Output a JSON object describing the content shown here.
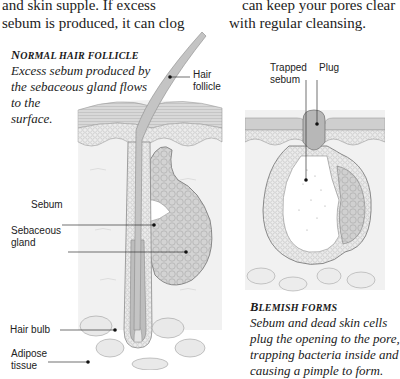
{
  "body_text": {
    "left_lines": [
      "and skin supple. If excess",
      "sebum is produced, it can clog"
    ],
    "right_lines": [
      "can keep your pores clear",
      "with regular cleansing."
    ]
  },
  "left_figure": {
    "title_first": "N",
    "title_rest": "ORMAL HAIR FOLLICLE",
    "caption_lines": [
      "Excess sebum produced by",
      "the sebaceous gland flows",
      "to the",
      "surface."
    ],
    "labels": {
      "hair_follicle_1": "Hair",
      "hair_follicle_2": "follicle",
      "sebum": "Sebum",
      "sebaceous_gland_1": "Sebaceous",
      "sebaceous_gland_2": "gland",
      "hair_bulb": "Hair bulb",
      "adipose_1": "Adipose",
      "adipose_2": "tissue"
    }
  },
  "right_figure": {
    "title_first": "B",
    "title_rest": "LEMISH FORMS",
    "caption_lines": [
      "Sebum and dead skin cells",
      "plug the opening to the pore,",
      "trapping bacteria inside and",
      "causing a pimple to form."
    ],
    "labels": {
      "trapped_sebum_1": "Trapped",
      "trapped_sebum_2": "sebum",
      "plug": "Plug"
    }
  },
  "colors": {
    "skin_top": "#c8c8c8",
    "skin_mid": "#e2e2e2",
    "dermis": "#efefef",
    "gland": "#cfcfcf",
    "hair": "#b8b8b8",
    "line": "#555555"
  }
}
